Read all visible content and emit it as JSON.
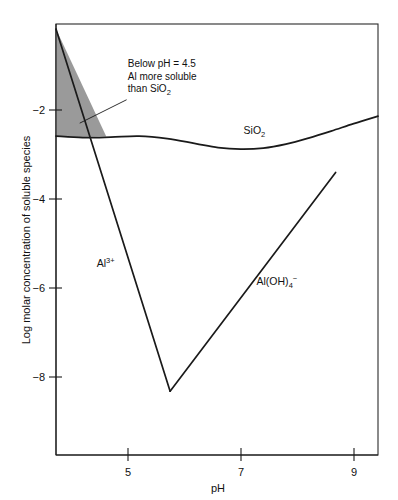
{
  "chart_data": {
    "type": "line",
    "title": "",
    "xlabel": "pH",
    "ylabel": "Log molar concentration of soluble species",
    "xlim": [
      3.73,
      9.43
    ],
    "ylim": [
      -9.4,
      -0.75
    ],
    "xticks": [
      5,
      7,
      9
    ],
    "xtick_labels": [
      "5",
      "7",
      "9"
    ],
    "yticks": [
      -2,
      -4,
      -6,
      -8
    ],
    "ytick_labels": [
      "−2",
      "−4",
      "−6",
      "−8"
    ],
    "grid": false,
    "legend": "inline-labels",
    "series": [
      {
        "name": "SiO2",
        "label_text": "SiO",
        "label_sub": "2",
        "label_sup": "",
        "label_x": 7.05,
        "label_y": -2.95,
        "x": [
          3.73,
          4.2,
          4.7,
          5.2,
          5.7,
          6.2,
          6.6,
          7.0,
          7.4,
          7.8,
          8.2,
          8.6,
          9.0,
          9.43
        ],
        "y": [
          -3.0,
          -3.03,
          -3.02,
          -3.0,
          -3.05,
          -3.15,
          -3.23,
          -3.26,
          -3.24,
          -3.16,
          -3.04,
          -2.9,
          -2.75,
          -2.6
        ]
      },
      {
        "name": "Al3+",
        "label_text": "Al",
        "label_sub": "",
        "label_sup": "3+",
        "label_x": 4.45,
        "label_y": -5.62,
        "x": [
          3.73,
          5.75
        ],
        "y": [
          -0.85,
          -8.12
        ]
      },
      {
        "name": "Al(OH)4-",
        "label_text": "Al(OH)",
        "label_sub": "4",
        "label_sup": "−",
        "label_x": 7.28,
        "label_y": -5.98,
        "x": [
          5.75,
          8.68
        ],
        "y": [
          -8.12,
          -3.73
        ]
      }
    ],
    "shaded_region": {
      "name": "Al more soluble than SiO2 region",
      "color": "#9a9a9a",
      "description": "Region below pH 4.5 bounded by the left axis, the Al3+ line and the SiO2 curve",
      "x": [
        3.73,
        3.73,
        4.15,
        4.62
      ],
      "y": [
        -0.85,
        -3.0,
        -3.02,
        -3.01
      ]
    },
    "annotations": [
      {
        "name": "below-ph-note",
        "lines": [
          {
            "text": "Below pH = 4.5",
            "sub": "",
            "tail": ""
          },
          {
            "text": "Al more soluble",
            "sub": "",
            "tail": ""
          },
          {
            "text": "than SiO",
            "sub": "2",
            "tail": ""
          }
        ],
        "x": 5.0,
        "y": -1.62,
        "leader_from": {
          "x": 4.15,
          "y": -2.74
        },
        "leader_to": {
          "x": 4.98,
          "y": -2.27
        }
      }
    ]
  }
}
